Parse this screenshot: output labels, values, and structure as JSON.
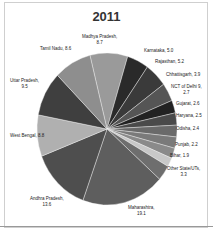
{
  "chart_data": {
    "type": "pie",
    "title": "2011",
    "categories": [
      "Madhya Pradesh",
      "Karnataka",
      "Rajasthan",
      "Chhattisgarh",
      "NCT of Delhi",
      "Gujarat",
      "Haryana",
      "Odisha",
      "Punjab",
      "Bihar",
      "Other State/UTs",
      "Maharashtra",
      "Andhra Pradesh",
      "West Bengal",
      "Uttar Pradesh",
      "Tamil Nadu"
    ],
    "values": [
      8.7,
      5.0,
      5.2,
      3.9,
      2.7,
      2.6,
      2.5,
      2.4,
      2.2,
      1.9,
      3.3,
      19.1,
      13.6,
      8.8,
      9.5,
      8.6
    ],
    "labels": [
      "Madhya Pradesh, 8.7",
      "Karnataka, 5.0",
      "Rajasthan, 5.2",
      "Chhattisgarh, 3.9",
      "NCT of Delhi 9, 2.7",
      "Gujarat, 2.6",
      "Haryana, 2.5",
      "Odisha, 2.4",
      "Punjab, 2.2",
      "Bihar, 1.9",
      "Other State/UTs, 3.3",
      "Maharashtra, 19.1",
      "Andhra Pradesh, 13.6",
      "West Bengal, 8.8",
      "Uttar Pradesh, 9.5",
      "Tamil Nadu, 8.6"
    ],
    "colors": [
      "#9a9a9a",
      "#2a2a2a",
      "#3a3a3a",
      "#555555",
      "#222222",
      "#4a4a4a",
      "#6a6a6a",
      "#7a7a7a",
      "#8a8a8a",
      "#c8c8c8",
      "#6e6e6e",
      "#5e5e5e",
      "#4e4e4e",
      "#b0b0b0",
      "#3f3f3f",
      "#8e8e8e"
    ],
    "legend": "none (data labels)"
  },
  "labels": {
    "title": "2011",
    "mp_a": "Madhya Pradesh,",
    "mp_b": "8.7",
    "ka": "Karnataka, 5.0",
    "rj": "Rajasthan, 5.2",
    "cg": "Chhattisgarh, 3.9",
    "dl_a": "NCT of Delhi 9,",
    "dl_b": "2.7",
    "gj": "Gujarat, 2.6",
    "hr": "Haryana, 2.5",
    "od": "Odisha, 2.4",
    "pb": "Punjab, 2.2",
    "br": "Bihar, 1.9",
    "ot_a": "Other State/UTs,",
    "ot_b": "3.3",
    "mh_a": "Maharashtra,",
    "mh_b": "19.1",
    "ap_a": "Andhra Pradesh,",
    "ap_b": "13.6",
    "wb": "West Bengal, 8.8",
    "up_a": "Uttar Pradesh,",
    "up_b": "9.5",
    "tn": "Tamil Nadu, 8.6"
  }
}
